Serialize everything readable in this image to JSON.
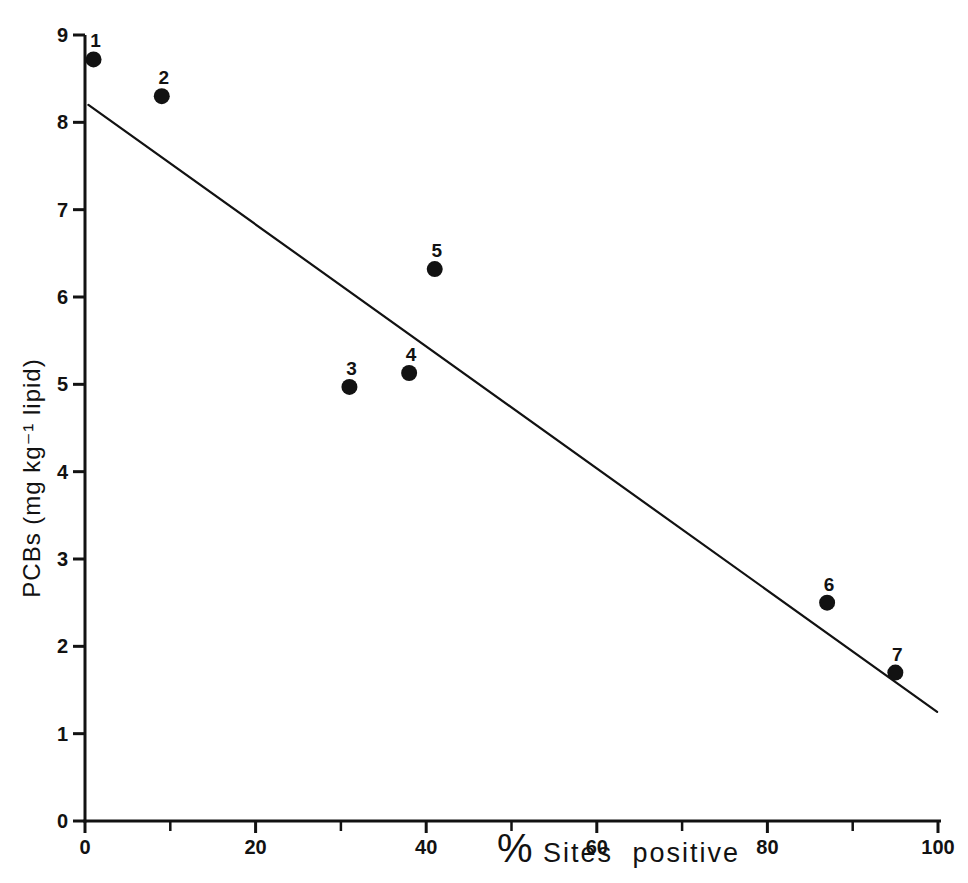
{
  "figure": {
    "background_color": "#ffffff",
    "ink_color": "#121212"
  },
  "chart_data": {
    "type": "scatter",
    "title": "",
    "xlabel": "% Sites positive",
    "xlabel_symbol": "%",
    "xlabel_words": "Sites positive",
    "ylabel": "PCBs (mg kg⁻¹ lipid)",
    "xlim": [
      0,
      100
    ],
    "ylim": [
      0,
      9
    ],
    "grid": false,
    "legend": false,
    "x_major_ticks": [
      0,
      20,
      40,
      60,
      80,
      100
    ],
    "x_major_tick_labels": [
      "0",
      "20",
      "40",
      "60",
      "80",
      "100"
    ],
    "x_minor_ticks": [
      10,
      30,
      50,
      70,
      90
    ],
    "y_ticks": [
      0,
      1,
      2,
      3,
      4,
      5,
      6,
      7,
      8,
      9
    ],
    "y_tick_labels": [
      "0",
      "1",
      "2",
      "3",
      "4",
      "5",
      "6",
      "7",
      "8",
      "9"
    ],
    "points": [
      {
        "label": "1",
        "x": 1,
        "y": 8.72
      },
      {
        "label": "2",
        "x": 9,
        "y": 8.3
      },
      {
        "label": "3",
        "x": 31,
        "y": 4.97
      },
      {
        "label": "4",
        "x": 38,
        "y": 5.13
      },
      {
        "label": "5",
        "x": 41,
        "y": 6.32
      },
      {
        "label": "6",
        "x": 87,
        "y": 2.5
      },
      {
        "label": "7",
        "x": 95,
        "y": 1.7
      }
    ],
    "regression_line": {
      "x1": 0.4,
      "y1": 8.2,
      "x2": 99.9,
      "y2": 1.25
    },
    "marker": {
      "shape": "filled-circle",
      "radius_px": 8,
      "color": "#121212"
    }
  }
}
